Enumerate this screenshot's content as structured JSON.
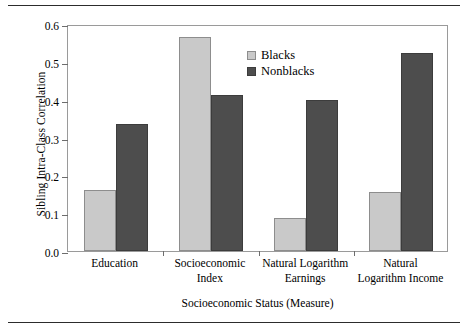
{
  "chart_data": {
    "type": "bar",
    "title": "",
    "xlabel": "Socioeconomic Status (Measure)",
    "ylabel": "Sibling Intra-Class Correlation",
    "categories": [
      "Education",
      "Socioeconomic Index",
      "Natural Logarithm Earnings",
      "Natural Logarithm Income"
    ],
    "category_lines": [
      [
        "Education",
        ""
      ],
      [
        "Socioeconomic",
        "Index"
      ],
      [
        "Natural Logarithm",
        "Earnings"
      ],
      [
        "Natural",
        "Logarithm Income"
      ]
    ],
    "series": [
      {
        "name": "Blacks",
        "color": "#c9c9c9",
        "values": [
          0.16,
          0.565,
          0.088,
          0.157
        ]
      },
      {
        "name": "Nonblacks",
        "color": "#4d4d4d",
        "values": [
          0.335,
          0.412,
          0.399,
          0.523
        ]
      }
    ],
    "ylim": [
      0.0,
      0.6
    ],
    "yticks": [
      0.0,
      0.1,
      0.2,
      0.3,
      0.4,
      0.5,
      0.6
    ],
    "ytick_labels": [
      "0.0",
      "0.1",
      "0.2",
      "0.3",
      "0.4",
      "0.5",
      "0.6"
    ],
    "grid": false,
    "legend_position": "top-center-left",
    "legend_entries": [
      "Blacks",
      "Nonblacks"
    ]
  }
}
